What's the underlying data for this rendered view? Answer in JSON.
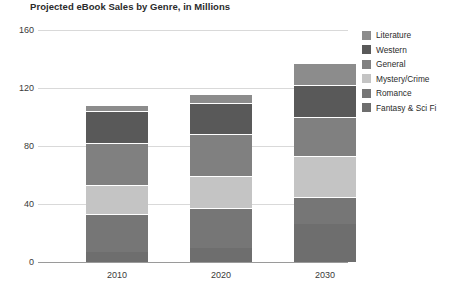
{
  "chart_data": {
    "type": "bar",
    "subtype": "stacked-vertical",
    "title": "Projected eBook Sales by Genre, in Millions",
    "xlabel": "",
    "ylabel": "",
    "categories": [
      "2010",
      "2020",
      "2030"
    ],
    "ylim": [
      0,
      160
    ],
    "yticks": [
      0,
      40,
      80,
      120,
      160
    ],
    "ytick_labels": [
      "0",
      "40",
      "80",
      "120",
      "160"
    ],
    "grid": true,
    "grid_axis": "y",
    "legend_position": "right",
    "stack_order_bottom_to_top": [
      "Fantasy & Sci Fi",
      "Romance",
      "Mystery/Crime",
      "General",
      "Western",
      "Literature"
    ],
    "series": [
      {
        "name": "Literature",
        "color": "#8c8c8c",
        "values": [
          4,
          6,
          15
        ]
      },
      {
        "name": "Western",
        "color": "#595959",
        "values": [
          22,
          22,
          22
        ]
      },
      {
        "name": "General",
        "color": "#808080",
        "values": [
          29,
          29,
          27
        ]
      },
      {
        "name": "Mystery/Crime",
        "color": "#c4c4c4",
        "values": [
          20,
          22,
          28
        ]
      },
      {
        "name": "Romance",
        "color": "#767676",
        "values": [
          26,
          27,
          19
        ]
      },
      {
        "name": "Fantasy & Sci Fi",
        "color": "#6e6e6e",
        "values": [
          7,
          10,
          26
        ]
      }
    ],
    "totals": [
      108,
      116,
      137
    ]
  },
  "legend": {
    "items": [
      {
        "label": "Literature",
        "color": "#8c8c8c"
      },
      {
        "label": "Western",
        "color": "#595959"
      },
      {
        "label": "General",
        "color": "#808080"
      },
      {
        "label": "Mystery/Crime",
        "color": "#c4c4c4"
      },
      {
        "label": "Romance",
        "color": "#767676"
      },
      {
        "label": "Fantasy & Sci Fi",
        "color": "#6e6e6e"
      }
    ]
  }
}
